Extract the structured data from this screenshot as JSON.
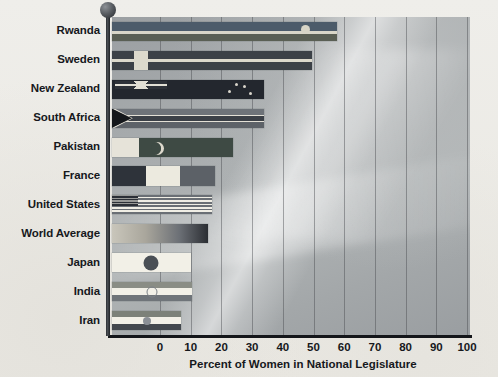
{
  "chart_data": {
    "type": "bar",
    "orientation": "horizontal",
    "title": "",
    "xlabel": "Percent of Women in National Legislature",
    "ylabel": "",
    "xlim": [
      0,
      100
    ],
    "xticks": [
      "0",
      "10",
      "20",
      "30",
      "40",
      "50",
      "60",
      "70",
      "80",
      "90",
      "100"
    ],
    "grid": "vertical",
    "legend": "none",
    "categories": [
      "Rwanda",
      "Sweden",
      "New Zealand",
      "South Africa",
      "Pakistan",
      "France",
      "United States",
      "World Average",
      "Japan",
      "India",
      "Iran"
    ],
    "values": [
      57.5,
      49.5,
      34,
      34,
      23.8,
      18,
      17,
      15.5,
      10,
      10.4,
      7
    ],
    "bar_style": "national flag fill",
    "series": [
      {
        "name": "Percent of Women in National Legislature",
        "values": [
          57.5,
          49.5,
          34,
          34,
          23.8,
          18,
          17,
          15.5,
          10,
          10.4,
          7
        ]
      }
    ]
  },
  "decor": {
    "flagpole": "flagpole",
    "finial": "pole-ball-finial",
    "background": "sky"
  },
  "colors": {
    "axis": "#14161a",
    "text": "#16181c",
    "plot_bg": "#a7abad",
    "page_bg": "#eceae5",
    "gridline": "#464a4e"
  }
}
